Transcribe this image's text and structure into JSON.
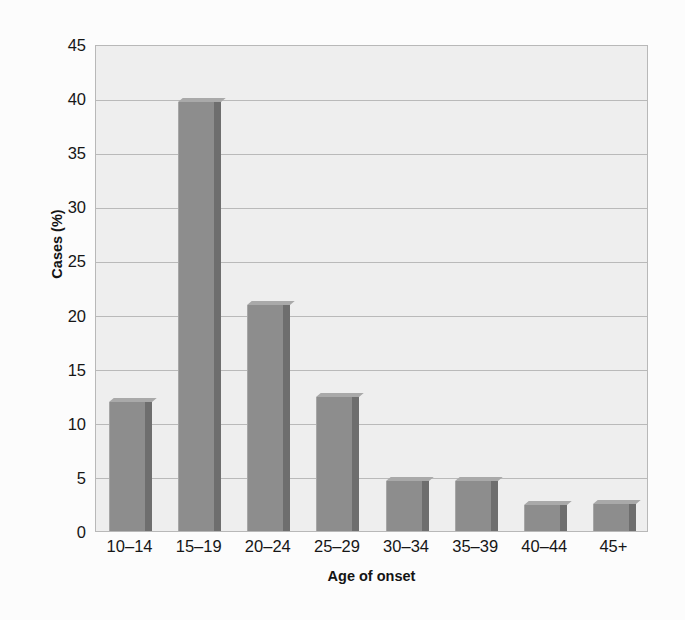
{
  "chart_data": {
    "type": "bar",
    "title": "",
    "subtitle": "",
    "xlabel": "Age of onset",
    "ylabel": "Cases (%)",
    "categories": [
      "10–14",
      "15–19",
      "20–24",
      "25–29",
      "30–34",
      "35–39",
      "40–44",
      "45+"
    ],
    "values": [
      11.9,
      39.6,
      20.9,
      12.4,
      4.6,
      4.6,
      2.4,
      2.5
    ],
    "series": [
      {
        "name": "Cases (%)",
        "values": [
          11.9,
          39.6,
          20.9,
          12.4,
          4.6,
          4.6,
          2.4,
          2.5
        ]
      }
    ],
    "ylim": [
      0,
      45
    ],
    "xlim": [
      0,
      8
    ],
    "ytick_labels": [
      "0",
      "5",
      "10",
      "15",
      "20",
      "25",
      "30",
      "35",
      "40",
      "45"
    ],
    "ytick_values": [
      0,
      5,
      10,
      15,
      20,
      25,
      30,
      35,
      40,
      45
    ],
    "ytick_step": 5,
    "grid": "horizontal",
    "legend": "none",
    "annotations": [],
    "colors": {
      "bar_face": "#8d8d8d",
      "bar_side": "#6e6e6e",
      "bar_top": "#a9a9a9",
      "plot_background": "#eeeeee",
      "gridline": "#b9b9b9",
      "axis_frame": "#b8b8b8",
      "text": "#161616",
      "figure_background": "#fcfcfc"
    }
  }
}
